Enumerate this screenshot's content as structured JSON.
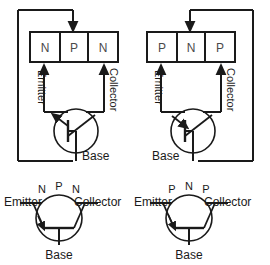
{
  "diagram": {
    "stroke_color": "#1a1a1a",
    "region_text_color": "#555555",
    "label_color": "#1a1a1a",
    "background": "#ffffff"
  },
  "circuits": [
    {
      "id": "npn-circuit",
      "type": "NPN",
      "regions": [
        {
          "letter": "N",
          "role": "emitter"
        },
        {
          "letter": "P",
          "role": "base"
        },
        {
          "letter": "N",
          "role": "collector"
        }
      ],
      "labels": {
        "emitter": "Emitter",
        "collector": "Collector",
        "base": "Base"
      }
    },
    {
      "id": "pnp-circuit",
      "type": "PNP",
      "regions": [
        {
          "letter": "P",
          "role": "emitter"
        },
        {
          "letter": "N",
          "role": "base"
        },
        {
          "letter": "P",
          "role": "collector"
        }
      ],
      "labels": {
        "emitter": "Emitter",
        "collector": "Collector",
        "base": "Base"
      }
    }
  ],
  "symbols": [
    {
      "id": "npn-symbol",
      "type": "NPN",
      "region_letters": [
        "N",
        "P",
        "N"
      ],
      "labels": {
        "emitter": "Emitter",
        "collector": "Collector",
        "base": "Base"
      }
    },
    {
      "id": "pnp-symbol",
      "type": "PNP",
      "region_letters": [
        "P",
        "N",
        "P"
      ],
      "labels": {
        "emitter": "Emitter",
        "collector": "Collector",
        "base": "Base"
      }
    }
  ]
}
